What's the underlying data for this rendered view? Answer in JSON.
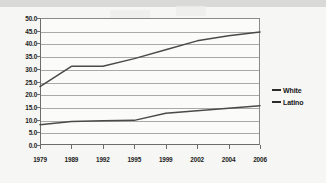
{
  "chart_data": {
    "type": "line",
    "title": "",
    "xlabel": "",
    "ylabel": "",
    "categories": [
      "1979",
      "1989",
      "1992",
      "1995",
      "1999",
      "2002",
      "2004",
      "2006"
    ],
    "series": [
      {
        "name": "White",
        "values": [
          23.0,
          31.0,
          31.0,
          34.0,
          37.5,
          41.0,
          43.0,
          44.5
        ]
      },
      {
        "name": "Latino",
        "values": [
          8.0,
          9.3,
          9.5,
          9.7,
          12.5,
          13.5,
          14.5,
          15.5
        ]
      }
    ],
    "ylim": [
      0.0,
      50.0
    ],
    "ytick_labels": [
      "50.0",
      "45.0",
      "40.0",
      "35.0",
      "30.0",
      "25.0",
      "20.0",
      "15.0",
      "10.0",
      "5.0",
      "0.0"
    ],
    "ytick_values": [
      50.0,
      45.0,
      40.0,
      35.0,
      30.0,
      25.0,
      20.0,
      15.0,
      10.0,
      5.0,
      0.0
    ],
    "grid": true,
    "legend_position": "right",
    "line_color": "#4a4a4a"
  },
  "legend": {
    "items": [
      {
        "label": "White"
      },
      {
        "label": "Latino"
      }
    ]
  }
}
